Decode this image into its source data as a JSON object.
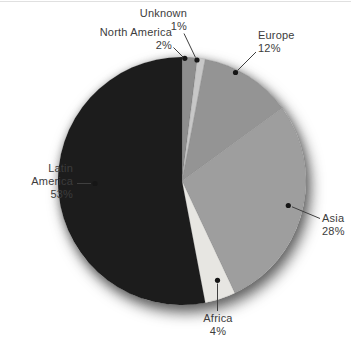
{
  "page": {
    "background": "#ffffff",
    "top_border_color": "#e0e0e0",
    "text_color": "#3c3c3c",
    "leader_line_color": "#3f3f3f",
    "leader_dot_color": "#161616"
  },
  "chart_data": {
    "type": "pie",
    "title": "",
    "direction": "clockwise",
    "start_angle_deg": 0,
    "legend": "none",
    "labels_position": "outside-with-leader-lines",
    "categories": [
      "North America",
      "Unknown",
      "Europe",
      "Asia",
      "Africa",
      "Latin America"
    ],
    "values": [
      2,
      1,
      12,
      28,
      4,
      53
    ],
    "slices": [
      {
        "label": "North America",
        "value": 2,
        "percent_label": "2%",
        "color": "#8d8d8d"
      },
      {
        "label": "Unknown",
        "value": 1,
        "percent_label": "1%",
        "color": "#c7c7c7"
      },
      {
        "label": "Europe",
        "value": 12,
        "percent_label": "12%",
        "color": "#949494"
      },
      {
        "label": "Asia",
        "value": 28,
        "percent_label": "28%",
        "color": "#9e9e9e"
      },
      {
        "label": "Africa",
        "value": 4,
        "percent_label": "4%",
        "color": "#e7e6e2"
      },
      {
        "label": "Latin America",
        "value": 53,
        "percent_label": "53%",
        "color": "#1c1c1c"
      }
    ]
  },
  "labels": {
    "unknown": {
      "lines": [
        "Unknown",
        "1%"
      ]
    },
    "north_america": {
      "lines": [
        "North America",
        "2%"
      ]
    },
    "europe": {
      "lines": [
        "Europe",
        "12%"
      ]
    },
    "asia": {
      "lines": [
        "Asia",
        "28%"
      ]
    },
    "latin_america": {
      "lines": [
        "Latin",
        "America",
        "53%"
      ]
    },
    "africa": {
      "lines": [
        "Africa",
        "4%"
      ]
    }
  }
}
